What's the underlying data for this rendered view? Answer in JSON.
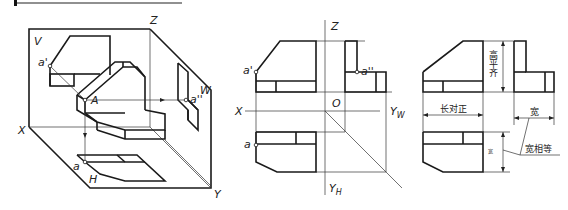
{
  "figure": {
    "type": "three-view orthographic projection of a point on a solid",
    "header_bar": {
      "present": true
    }
  },
  "pictorial_view": {
    "planes": {
      "V": "V",
      "H": "H",
      "W": "W"
    },
    "axes": {
      "x": "X",
      "y": "Y",
      "z": "Z"
    },
    "points": {
      "space": "A",
      "front": "a'",
      "top": "a",
      "side": "a''"
    }
  },
  "projection_view": {
    "axes": {
      "x": "X",
      "z": "Z",
      "origin": "O",
      "yw": "Y",
      "yw_sub": "W",
      "yh": "Y",
      "yh_sub": "H"
    },
    "points": {
      "front": "a'",
      "top": "a",
      "side": "a''"
    }
  },
  "rules_view": {
    "labels": {
      "long_aligned": "长对正",
      "high_level": "高平齐",
      "width": "宽",
      "width_small": "宽",
      "width_equal": "宽相等"
    }
  }
}
